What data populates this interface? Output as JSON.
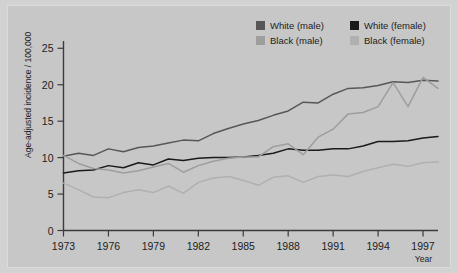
{
  "chart_data": {
    "type": "line",
    "title": "",
    "xlabel": "Year",
    "ylabel": "Age-adjusted incidence / 100,000",
    "xlim": [
      1973,
      1998
    ],
    "ylim": [
      0,
      26
    ],
    "grid": false,
    "legend_position": "top-right",
    "xticks": [
      "1973",
      "1976",
      "1979",
      "1982",
      "1985",
      "1988",
      "1991",
      "1994",
      "1997"
    ],
    "xtick_values": [
      1973,
      1976,
      1979,
      1982,
      1985,
      1988,
      1991,
      1994,
      1997
    ],
    "yticks": [
      "0",
      "5",
      "10",
      "15",
      "20",
      "25"
    ],
    "ytick_values": [
      0,
      5,
      10,
      15,
      20,
      25
    ],
    "x": [
      1973,
      1974,
      1975,
      1976,
      1977,
      1978,
      1979,
      1980,
      1981,
      1982,
      1983,
      1984,
      1985,
      1986,
      1987,
      1988,
      1989,
      1990,
      1991,
      1992,
      1993,
      1994,
      1995,
      1996,
      1997,
      1998
    ],
    "series": [
      {
        "name": "White (male)",
        "color": "#575757",
        "values": [
          10.2,
          10.6,
          10.3,
          11.2,
          10.8,
          11.4,
          11.6,
          12.0,
          12.4,
          12.3,
          13.3,
          14.0,
          14.6,
          15.1,
          15.8,
          16.4,
          17.6,
          17.5,
          18.7,
          19.5,
          19.6,
          19.9,
          20.4,
          20.3,
          20.6,
          20.5
        ]
      },
      {
        "name": "White (female)",
        "color": "#1a1a1a",
        "values": [
          7.9,
          8.2,
          8.3,
          8.9,
          8.6,
          9.3,
          9.0,
          9.8,
          9.6,
          9.9,
          10.0,
          10.0,
          10.1,
          10.3,
          10.6,
          11.2,
          11.0,
          11.0,
          11.2,
          11.2,
          11.6,
          12.2,
          12.2,
          12.3,
          12.7,
          12.9
        ]
      },
      {
        "name": "Black (male)",
        "color": "#9e9e9e",
        "values": [
          10.3,
          9.2,
          8.5,
          8.3,
          7.9,
          8.2,
          8.7,
          9.2,
          8.0,
          8.9,
          9.5,
          9.9,
          10.1,
          10.1,
          11.5,
          11.9,
          10.4,
          12.8,
          13.9,
          16.0,
          16.2,
          17.0,
          20.3,
          17.0,
          21.0,
          19.5
        ]
      },
      {
        "name": "Black (female)",
        "color": "#b0b0b0",
        "values": [
          6.5,
          5.6,
          4.6,
          4.5,
          5.2,
          5.6,
          5.2,
          6.1,
          5.1,
          6.6,
          7.2,
          7.4,
          6.9,
          6.2,
          7.3,
          7.5,
          6.6,
          7.4,
          7.6,
          7.4,
          8.1,
          8.6,
          9.1,
          8.8,
          9.3,
          9.4
        ]
      }
    ]
  },
  "legend": {
    "items": [
      {
        "label": "White (male)",
        "color": "#575757"
      },
      {
        "label": "White (female)",
        "color": "#1a1a1a"
      },
      {
        "label": "Black (male)",
        "color": "#9e9e9e"
      },
      {
        "label": "Black (female)",
        "color": "#b0b0b0"
      }
    ]
  }
}
